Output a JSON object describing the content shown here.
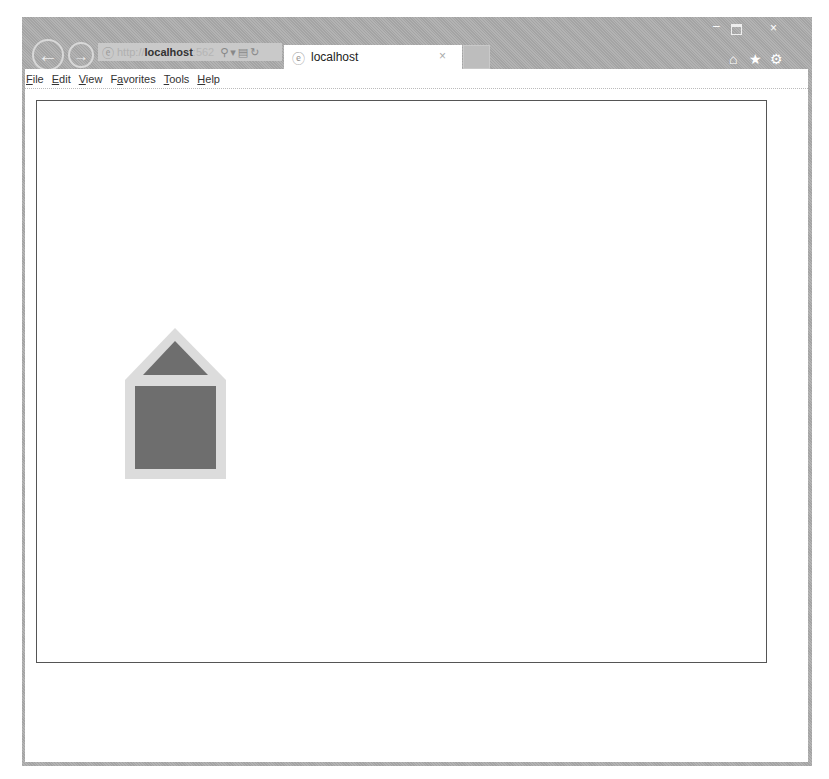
{
  "browser": {
    "address": {
      "protocol": "http://",
      "host": "localhost",
      "port": ":562",
      "search_icon": "search-icon",
      "dropdown_icon": "chevron-down-icon",
      "compat_icon": "compatibility-icon",
      "refresh_icon": "refresh-icon"
    },
    "tab": {
      "title": "localhost",
      "close_glyph": "×"
    },
    "nav": {
      "back_glyph": "←",
      "forward_glyph": "→"
    },
    "window_controls": {
      "minimize_glyph": "–",
      "close_glyph": "×"
    },
    "utility_icons": {
      "home_glyph": "⌂",
      "favorites_glyph": "★",
      "tools_glyph": "⚙"
    },
    "menu": [
      {
        "pre": "",
        "ul": "F",
        "post": "ile"
      },
      {
        "pre": "",
        "ul": "E",
        "post": "dit"
      },
      {
        "pre": "",
        "ul": "V",
        "post": "iew"
      },
      {
        "pre": "F",
        "ul": "a",
        "post": "vorites"
      },
      {
        "pre": "",
        "ul": "T",
        "post": "ools"
      },
      {
        "pre": "",
        "ul": "H",
        "post": "elp"
      }
    ]
  },
  "canvas": {
    "shapes": {
      "outline_color": "#dcdcdc",
      "fill_color": "#6e6e6e",
      "house": {
        "outer": "0,0 50,0 101,52 101,151 0,151 0,52",
        "roof": "50,13 83,47 18,47",
        "body": {
          "x": 10,
          "y": 58,
          "w": 81,
          "h": 83
        }
      }
    }
  }
}
